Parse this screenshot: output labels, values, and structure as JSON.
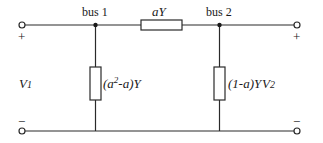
{
  "diagram": {
    "type": "circuit",
    "colors": {
      "line": "#2a2a2a",
      "background": "#ffffff"
    },
    "buses": [
      {
        "id": "bus1",
        "label": "bus 1"
      },
      {
        "id": "bus2",
        "label": "bus 2"
      }
    ],
    "elements": {
      "series": {
        "label": "aY",
        "between": [
          "bus1",
          "bus2"
        ]
      },
      "shunt_bus1": {
        "label_pre": "(a",
        "label_sup": "2",
        "label_post": "-a)Y",
        "full": "(a²-a)Y"
      },
      "shunt_bus2": {
        "label": "(1-a)Y"
      }
    },
    "ports": {
      "left": {
        "voltage": "V",
        "voltage_sub": "1",
        "plus": "+",
        "minus": "−"
      },
      "right": {
        "voltage": "V",
        "voltage_sub": "2",
        "plus": "+",
        "minus": "−"
      }
    }
  }
}
